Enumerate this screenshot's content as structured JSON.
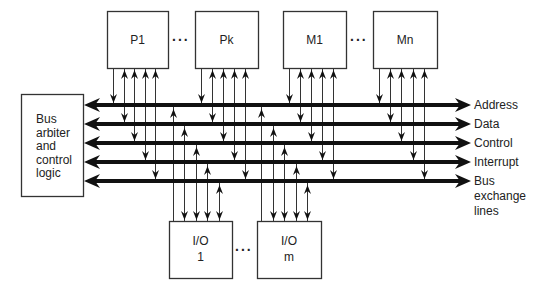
{
  "diagram": {
    "type": "system-bus-architecture",
    "processors": [
      {
        "id": "P1",
        "label": "P1",
        "x": 107,
        "y": 11,
        "w": 61,
        "h": 57
      },
      {
        "id": "Pk",
        "label": "Pk",
        "x": 195,
        "y": 11,
        "w": 63,
        "h": 57
      }
    ],
    "memories": [
      {
        "id": "M1",
        "label": "M1",
        "x": 283,
        "y": 11,
        "w": 63,
        "h": 57
      },
      {
        "id": "Mn",
        "label": "Mn",
        "x": 373,
        "y": 11,
        "w": 64,
        "h": 57
      }
    ],
    "io_modules": [
      {
        "id": "IO1",
        "label_line1": "I/O",
        "label_line2": "1",
        "x": 169,
        "y": 221,
        "w": 63,
        "h": 57
      },
      {
        "id": "IOm",
        "label_line1": "I/O",
        "label_line2": "m",
        "x": 257,
        "y": 221,
        "w": 64,
        "h": 57
      }
    ],
    "arbiter": {
      "label_lines": [
        "Bus",
        "arbiter",
        "and",
        "control",
        "logic"
      ],
      "x": 21,
      "y": 94,
      "w": 62,
      "h": 102
    },
    "ellipsis": "...",
    "buses": [
      {
        "name": "Address",
        "label": "Address",
        "y": 105
      },
      {
        "name": "Data",
        "label": "Data",
        "y": 124
      },
      {
        "name": "Control",
        "label": "Control",
        "y": 143
      },
      {
        "name": "Interrupt",
        "label": "Interrupt",
        "y": 162
      },
      {
        "name": "Bus exchange lines",
        "label_lines": [
          "Bus",
          "exchange",
          "lines"
        ],
        "y": 181
      }
    ],
    "bus_x_start": 84,
    "bus_x_end": 471,
    "colors": {
      "line": "#111111",
      "thin_line": "#333333",
      "box_border": "#333333",
      "background": "#ffffff"
    }
  }
}
